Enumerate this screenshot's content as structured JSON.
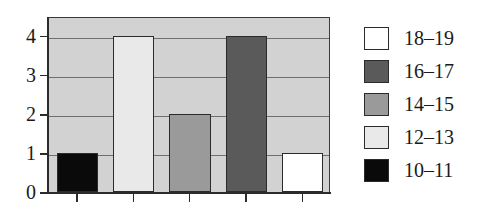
{
  "chart_data": {
    "type": "bar",
    "title": "",
    "subtitle": "",
    "xlabel": "",
    "ylabel": "",
    "categories": [
      "10–11",
      "12–13",
      "14–15",
      "16–17",
      "18–19"
    ],
    "values": [
      1,
      4,
      2,
      4,
      1
    ],
    "ylim": [
      0,
      4.5
    ],
    "yticks": [
      0,
      1,
      2,
      3,
      4
    ],
    "ytick_labels": [
      "0",
      "1",
      "2",
      "3",
      "4"
    ],
    "xticks": [
      1,
      2,
      3,
      4,
      5
    ],
    "xtick_labels": [
      "",
      "",
      "",
      "",
      ""
    ],
    "grid": true,
    "grid_axis": "y",
    "legend_position": "right",
    "plot_background": "#d2d2d2",
    "bar_colors": [
      "#0a0a0a",
      "#e9e9e9",
      "#9a9a9a",
      "#5a5a5a",
      "#ffffff"
    ],
    "bar_edge_color": "#2b2b2b",
    "legend": [
      {
        "label": "18–19",
        "color": "#ffffff"
      },
      {
        "label": "16–17",
        "color": "#5a5a5a"
      },
      {
        "label": "14–15",
        "color": "#9a9a9a"
      },
      {
        "label": "12–13",
        "color": "#e9e9e9"
      },
      {
        "label": "10–11",
        "color": "#0a0a0a"
      }
    ]
  }
}
